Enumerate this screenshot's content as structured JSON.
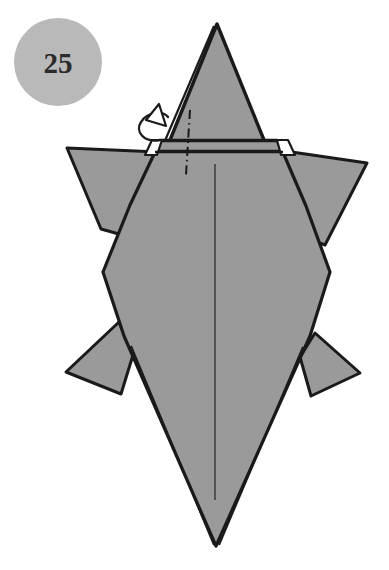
{
  "page": {
    "kind": "origami-instruction-diagram",
    "background_color": "#ffffff",
    "width": 389,
    "height": 570
  },
  "step_badge": {
    "label": "25",
    "shape": "circle",
    "fill_color": "#b9b9b9",
    "text_color": "#2b2b2b",
    "center": [
      58,
      62
    ],
    "radius": 44
  },
  "figure": {
    "paper_fill_color": "#9a9a9a",
    "outline_color": "#1a1a1a",
    "crease_color": "#3a3a3a",
    "outline_width": 3,
    "parts": [
      {
        "name": "head-point",
        "label": "head point (top triangle)"
      },
      {
        "name": "neck-collar",
        "label": "neck collar band"
      },
      {
        "name": "left-front-flipper",
        "label": "left front flipper"
      },
      {
        "name": "right-front-flipper",
        "label": "right front flipper"
      },
      {
        "name": "shell-body",
        "label": "shell body"
      },
      {
        "name": "left-rear-flipper",
        "label": "left rear flipper"
      },
      {
        "name": "right-rear-flipper",
        "label": "right rear flipper"
      },
      {
        "name": "tail-point",
        "label": "tail point (bottom V)"
      }
    ]
  },
  "annotations": {
    "center_crease": {
      "name": "center-crease-line",
      "style": "thin solid line",
      "from": [
        215,
        164
      ],
      "to": [
        215,
        500
      ]
    },
    "fold_line": {
      "name": "valley-fold-dash-dot-line",
      "style": "dash-dot",
      "from": [
        190,
        110
      ],
      "to": [
        186,
        175
      ]
    },
    "rotate_arrow": {
      "name": "tuck-loop-arrow",
      "style": "looping arrow with solid arrowhead",
      "direction": "up-right"
    }
  }
}
